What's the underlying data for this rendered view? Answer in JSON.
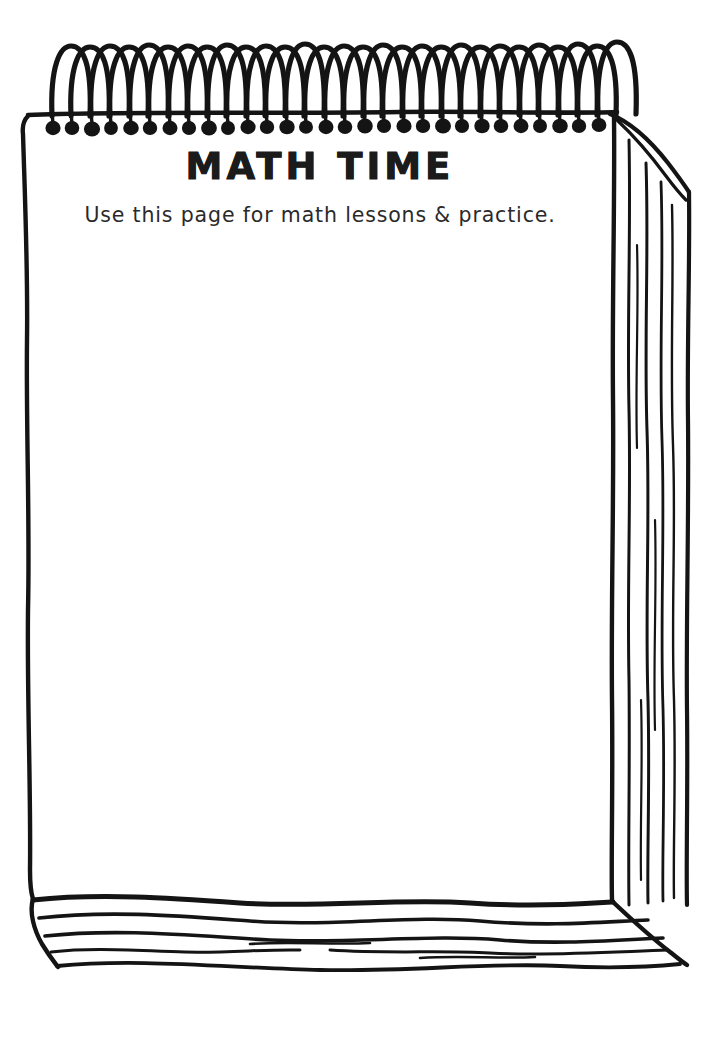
{
  "document": {
    "kind": "spiral-notepad-illustration",
    "title": "MATH TIME",
    "subtitle": "Use this page for math lessons & practice.",
    "writing_area_note": "",
    "colors": {
      "ink": "#1b1b1b",
      "paper": "#ffffff",
      "subtitle_ink": "#2a2a2a"
    }
  },
  "binding": {
    "coil_count": 29,
    "coil_first_x": 52,
    "coil_spacing": 19.6,
    "coil_top_y": 46,
    "bar_y": 113,
    "blob_y": 127
  },
  "page": {
    "left_x": 30,
    "right_x": 614,
    "top_y": 113,
    "bottom_y": 905,
    "stack_right_lines": 5,
    "stack_bottom_lines": 5
  }
}
